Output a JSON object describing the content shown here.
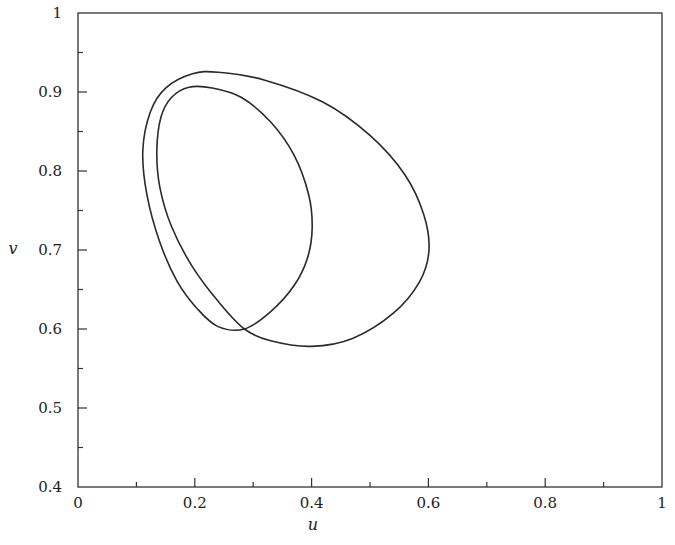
{
  "chart_data": {
    "type": "line",
    "title": "",
    "xlabel": "u",
    "ylabel": "v",
    "xlim": [
      0,
      1
    ],
    "ylim": [
      0.4,
      1
    ],
    "grid": false,
    "legend": null,
    "x_ticks": [
      {
        "value": 0,
        "label": "0"
      },
      {
        "value": 0.2,
        "label": "0.2"
      },
      {
        "value": 0.4,
        "label": "0.4"
      },
      {
        "value": 0.6,
        "label": "0.6"
      },
      {
        "value": 0.8,
        "label": "0.8"
      },
      {
        "value": 1,
        "label": "1"
      }
    ],
    "x_minor_ticks": [
      0.1,
      0.3,
      0.5,
      0.7,
      0.9
    ],
    "y_ticks": [
      {
        "value": 0.4,
        "label": "0.4"
      },
      {
        "value": 0.5,
        "label": "0.5"
      },
      {
        "value": 0.6,
        "label": "0.6"
      },
      {
        "value": 0.7,
        "label": "0.7"
      },
      {
        "value": 0.8,
        "label": "0.8"
      },
      {
        "value": 0.9,
        "label": "0.9"
      },
      {
        "value": 1,
        "label": "1"
      }
    ],
    "y_minor_ticks": [
      0.45,
      0.55,
      0.65,
      0.75,
      0.85,
      0.95
    ],
    "series": [
      {
        "name": "trajectory",
        "closed": true,
        "points": [
          [
            0.285,
            0.6
          ],
          [
            0.33,
            0.622
          ],
          [
            0.37,
            0.655
          ],
          [
            0.393,
            0.69
          ],
          [
            0.401,
            0.728
          ],
          [
            0.395,
            0.77
          ],
          [
            0.37,
            0.82
          ],
          [
            0.33,
            0.862
          ],
          [
            0.28,
            0.893
          ],
          [
            0.23,
            0.905
          ],
          [
            0.19,
            0.906
          ],
          [
            0.16,
            0.893
          ],
          [
            0.142,
            0.868
          ],
          [
            0.135,
            0.826
          ],
          [
            0.14,
            0.78
          ],
          [
            0.16,
            0.73
          ],
          [
            0.195,
            0.68
          ],
          [
            0.24,
            0.635
          ],
          [
            0.285,
            0.6
          ],
          [
            0.33,
            0.585
          ],
          [
            0.4,
            0.578
          ],
          [
            0.47,
            0.588
          ],
          [
            0.54,
            0.62
          ],
          [
            0.585,
            0.66
          ],
          [
            0.601,
            0.7
          ],
          [
            0.592,
            0.745
          ],
          [
            0.56,
            0.795
          ],
          [
            0.5,
            0.845
          ],
          [
            0.42,
            0.887
          ],
          [
            0.32,
            0.915
          ],
          [
            0.24,
            0.925
          ],
          [
            0.196,
            0.923
          ],
          [
            0.15,
            0.905
          ],
          [
            0.124,
            0.875
          ],
          [
            0.111,
            0.826
          ],
          [
            0.118,
            0.77
          ],
          [
            0.14,
            0.71
          ],
          [
            0.17,
            0.66
          ],
          [
            0.205,
            0.625
          ],
          [
            0.24,
            0.603
          ],
          [
            0.285,
            0.6
          ]
        ]
      }
    ]
  }
}
